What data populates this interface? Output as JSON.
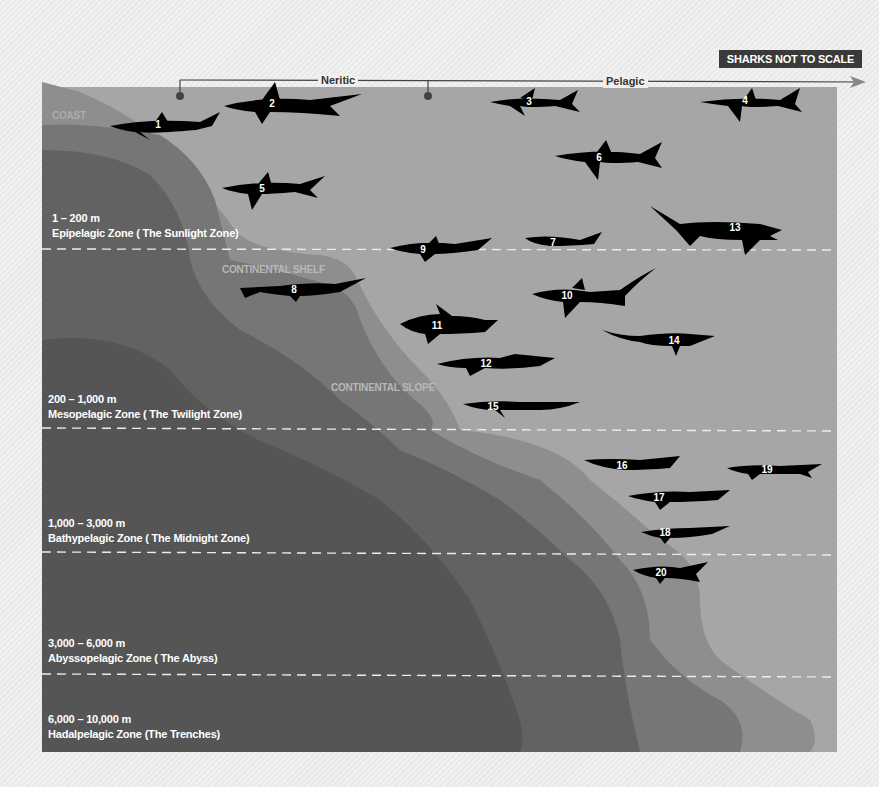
{
  "header": {
    "badge": "SHARKS NOT TO SCALE",
    "neritic_label": "Neritic",
    "pelagic_label": "Pelagic"
  },
  "geography": {
    "coast": "COAST",
    "continental_shelf": "CONTINENTAL SHELF",
    "continental_slope": "CONTINENTAL SLOPE"
  },
  "zones": [
    {
      "depth": "1 – 200 m",
      "name": "Epipelagic Zone ( The Sunlight Zone)"
    },
    {
      "depth": "200 – 1,000 m",
      "name": "Mesopelagic Zone ( The Twilight Zone)"
    },
    {
      "depth": "1,000 – 3,000 m",
      "name": "Bathypelagic Zone ( The Midnight Zone)"
    },
    {
      "depth": "3,000 – 6,000 m",
      "name": "Abyssopelagic Zone ( The Abyss)"
    },
    {
      "depth": "6,000 – 10,000 m",
      "name": "Hadalpelagic Zone (The Trenches)"
    }
  ],
  "sharks": [
    {
      "num": "1",
      "x": 158,
      "y": 124
    },
    {
      "num": "2",
      "x": 272,
      "y": 103
    },
    {
      "num": "3",
      "x": 529,
      "y": 101
    },
    {
      "num": "4",
      "x": 745,
      "y": 100
    },
    {
      "num": "5",
      "x": 262,
      "y": 188
    },
    {
      "num": "6",
      "x": 599,
      "y": 157
    },
    {
      "num": "7",
      "x": 553,
      "y": 242
    },
    {
      "num": "8",
      "x": 294,
      "y": 289
    },
    {
      "num": "9",
      "x": 423,
      "y": 249
    },
    {
      "num": "10",
      "x": 567,
      "y": 295
    },
    {
      "num": "11",
      "x": 437,
      "y": 325
    },
    {
      "num": "12",
      "x": 486,
      "y": 363
    },
    {
      "num": "13",
      "x": 735,
      "y": 227
    },
    {
      "num": "14",
      "x": 674,
      "y": 340
    },
    {
      "num": "15",
      "x": 493,
      "y": 406
    },
    {
      "num": "16",
      "x": 622,
      "y": 465
    },
    {
      "num": "17",
      "x": 659,
      "y": 497
    },
    {
      "num": "18",
      "x": 665,
      "y": 532
    },
    {
      "num": "19",
      "x": 767,
      "y": 469
    },
    {
      "num": "20",
      "x": 661,
      "y": 572
    }
  ],
  "colors": {
    "ocean": "#a6a6a6",
    "shelf_light": "#8a8a8a",
    "shelf_mid": "#707070",
    "deep": "#555555",
    "deepest": "#4a4a4a",
    "shark": "#000000",
    "dash": "#ececec"
  }
}
